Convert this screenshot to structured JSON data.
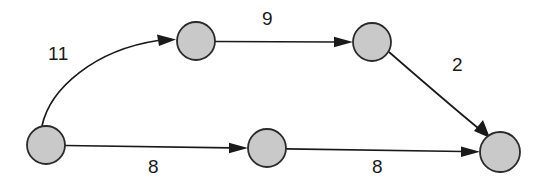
{
  "diagram": {
    "type": "directed-weighted-graph",
    "title": "",
    "background_color": "#ffffff",
    "node_fill_color": "#c9c9c9",
    "node_stroke_color": "#2b2b2b",
    "edge_color": "#1a1a1a",
    "label_color": "#1a1a1a",
    "nodes": [
      {
        "id": "A",
        "label": "",
        "cx": 46,
        "cy": 145,
        "r": 19
      },
      {
        "id": "B",
        "label": "",
        "cx": 196,
        "cy": 41,
        "r": 19
      },
      {
        "id": "C",
        "label": "",
        "cx": 372,
        "cy": 42,
        "r": 19
      },
      {
        "id": "D",
        "label": "",
        "cx": 267,
        "cy": 148,
        "r": 19
      },
      {
        "id": "E",
        "label": "",
        "cx": 500,
        "cy": 152,
        "r": 20
      }
    ],
    "edges": [
      {
        "id": "e-a-b",
        "from": "A",
        "to": "B",
        "weight": "11",
        "shape": "curved",
        "label_x": 48,
        "label_y": 44
      },
      {
        "id": "e-b-c",
        "from": "B",
        "to": "C",
        "weight": "9",
        "shape": "straight",
        "label_x": 262,
        "label_y": 9
      },
      {
        "id": "e-c-e",
        "from": "C",
        "to": "E",
        "weight": "2",
        "shape": "curved",
        "label_x": 452,
        "label_y": 55
      },
      {
        "id": "e-a-d",
        "from": "A",
        "to": "D",
        "weight": "8",
        "shape": "straight",
        "label_x": 148,
        "label_y": 157
      },
      {
        "id": "e-d-e",
        "from": "D",
        "to": "E",
        "weight": "8",
        "shape": "straight",
        "label_x": 372,
        "label_y": 157
      }
    ]
  }
}
